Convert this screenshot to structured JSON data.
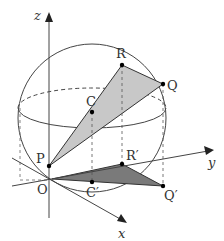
{
  "diagram": {
    "type": "3d-geometry-sphere-projection",
    "axes": {
      "x_label": "x",
      "y_label": "y",
      "z_label": "z",
      "origin_label": "O"
    },
    "points": {
      "P": "P",
      "Q": "Q",
      "R": "R",
      "C": "C",
      "Q_prime": "Q′",
      "R_prime": "R′",
      "C_prime": "C′"
    },
    "elements": [
      "sphere with center C",
      "dashed great circle (back half) and solid front arc",
      "triangle PQR shaded light gray",
      "projected triangle OQ'R' shaded dark gray on xy-plane",
      "dashed vertical projection lines R-R', Q-Q', C-C'"
    ],
    "colors": {
      "stroke": "#333333",
      "triangle_upper_fill": "#c8c8c8",
      "triangle_lower_fill": "#7a7a7a"
    }
  }
}
